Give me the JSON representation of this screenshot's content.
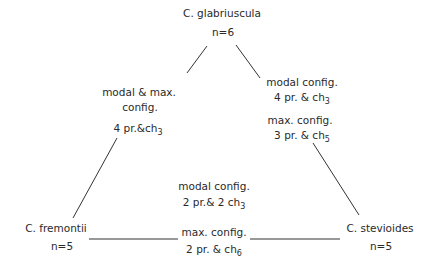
{
  "diagram": {
    "type": "triangle-relationship",
    "nodes": [
      {
        "id": "glabriuscula",
        "name": "C. glabriuscula",
        "count": "n=6"
      },
      {
        "id": "fremontii",
        "name": "C. fremontii",
        "count": "n=5"
      },
      {
        "id": "stevioides",
        "name": "C. stevioides",
        "count": "n=5"
      }
    ],
    "edges": [
      {
        "from": "glabriuscula",
        "to": "fremontii",
        "line1": "modal & max.",
        "line2": "config.",
        "config_base": "4 pr.&ch",
        "config_sub": "3"
      },
      {
        "from": "glabriuscula",
        "to": "stevioides",
        "modal_label": "modal config.",
        "modal_base": "4 pr. & ch",
        "modal_sub": "3",
        "max_label": "max. config.",
        "max_base": "3 pr. & ch",
        "max_sub": "5"
      },
      {
        "from": "fremontii",
        "to": "stevioides",
        "modal_label": "modal config.",
        "modal_base": "2 pr.& 2 ch",
        "modal_sub": "3",
        "max_label": "max. config.",
        "max_base": "2 pr. & ch",
        "max_sub": "6"
      }
    ]
  }
}
